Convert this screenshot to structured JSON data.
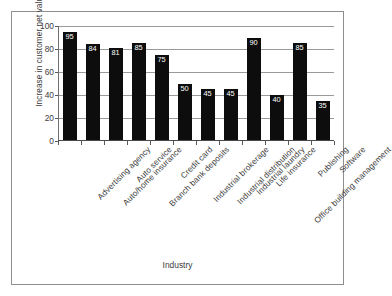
{
  "chart_data": {
    "type": "bar",
    "title": "",
    "xlabel": "Industry",
    "ylabel": "Increase in customer net value",
    "ylim": [
      0,
      100
    ],
    "yticks": [
      0,
      20,
      40,
      60,
      80,
      100
    ],
    "grid": true,
    "legend": false,
    "bar_color": "#0d0d0d",
    "gridline_color": "#9a9a9a",
    "background_color": "#ffffff",
    "border_color": "#8e8e90",
    "categories": [
      "Advertising agency",
      "Auto/home insurance",
      "Auto service",
      "Branch bank deposits",
      "Credit card",
      "Industrial brokerage",
      "Industrial distribution",
      "Industrial laundry",
      "Life insurance",
      "Office building management",
      "Publishing",
      "Software"
    ],
    "values": [
      95,
      84,
      81,
      85,
      75,
      50,
      45,
      45,
      90,
      40,
      85,
      35
    ]
  }
}
